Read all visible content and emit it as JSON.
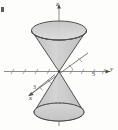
{
  "figure": {
    "background_color": "#fdfdfc",
    "surface_fill": "#c9c9c9",
    "surface_fill_light": "#d7d7d7",
    "outline_color": "#3f3f3f",
    "axis_color": "#6e6e6e",
    "label_color": "#3a3a3a"
  },
  "axes": {
    "z": {
      "label": "z",
      "direction": "up"
    },
    "y": {
      "label": "y",
      "direction": "right"
    },
    "x": {
      "label": "x",
      "direction": "lower-left"
    }
  },
  "ticks": {
    "y": {
      "label": "3",
      "value": 3
    },
    "x": {
      "label": "3",
      "value": 3
    }
  },
  "marks": {
    "corner": "page-edge-mark"
  }
}
